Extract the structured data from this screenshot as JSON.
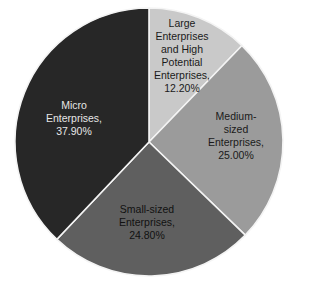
{
  "chart_data": {
    "type": "pie",
    "title": "",
    "start_angle_deg": 0,
    "direction": "clockwise",
    "center": [
      149,
      142
    ],
    "radius": 134,
    "slices": [
      {
        "name": "Large Enterprises and High Potential Enterprises",
        "value": 12.2,
        "label": "Large\nEnterprises\nand High\nPotential\nEnterprises,\n12.20%",
        "color": "#c9c9c9",
        "text_color": "#1a1a1a",
        "label_pos": [
          182,
          56
        ]
      },
      {
        "name": "Medium-sized Enterprises",
        "value": 25.0,
        "label": "Medium-sized\nEnterprises,\n25.00%",
        "color": "#9b9b9b",
        "text_color": "#1a1a1a",
        "label_pos": [
          236,
          136
        ]
      },
      {
        "name": "Small-sized Enterprises",
        "value": 24.8,
        "label": "Small-sized\nEnterprises,\n24.80%",
        "color": "#5f5f5f",
        "text_color": "#111111",
        "label_pos": [
          147,
          222
        ]
      },
      {
        "name": "Micro Enterprises",
        "value": 37.9,
        "label": "Micro\nEnterprises,\n37.90%",
        "color": "#272727",
        "text_color": "#e6e6e6",
        "label_pos": [
          74,
          118
        ]
      }
    ],
    "legend": null
  }
}
